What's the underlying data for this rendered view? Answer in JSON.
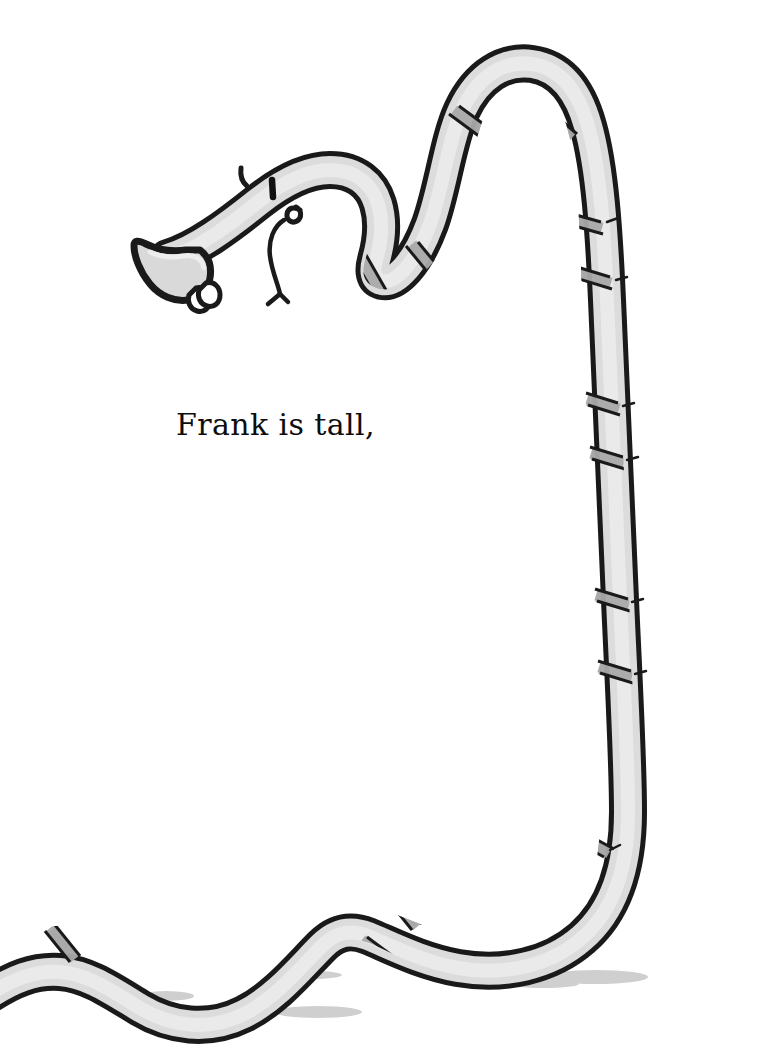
{
  "page": {
    "background_color": "#ffffff",
    "width": 781,
    "height": 1045
  },
  "caption": {
    "text": "Frank is tall,",
    "color": "#0d0d0d"
  },
  "illustration": {
    "title": "long-necked creature named Frank",
    "ink_color": "#1a1a1a",
    "body_fill_color": "#d8d8d8",
    "body_highlight_color": "#e6e6e6",
    "band_color": "#a8a8a8",
    "shadow_color": "#cfcfcf",
    "eye_color": "#111111",
    "parts": [
      {
        "name": "snout",
        "label": "trumpet-shaped snout"
      },
      {
        "name": "head",
        "label": "head with single horn"
      },
      {
        "name": "eye",
        "label": "eye"
      },
      {
        "name": "horn",
        "label": "horn"
      },
      {
        "name": "nostril-bumps",
        "label": "nostril bumps"
      },
      {
        "name": "tongue",
        "label": "dangling forked tongue"
      },
      {
        "name": "neck",
        "label": "long banded neck"
      },
      {
        "name": "body",
        "label": "undulating body along ground"
      },
      {
        "name": "bands",
        "label": "darker grey neck bands"
      },
      {
        "name": "ground-shadows",
        "label": "ground shadows"
      }
    ],
    "ground_shadows": [
      {
        "cx": 166,
        "cy": 996,
        "rx": 28,
        "ry": 5
      },
      {
        "cx": 312,
        "cy": 975,
        "rx": 30,
        "ry": 4
      },
      {
        "cx": 318,
        "cy": 1012,
        "rx": 42,
        "ry": 6
      },
      {
        "cx": 545,
        "cy": 984,
        "rx": 40,
        "ry": 5
      },
      {
        "cx": 592,
        "cy": 978,
        "rx": 52,
        "ry": 7
      }
    ]
  }
}
